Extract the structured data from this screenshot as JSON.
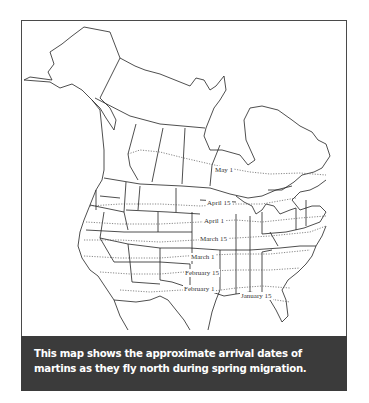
{
  "map": {
    "title": "Martin spring migration arrival dates",
    "region": "North America",
    "isolines": [
      {
        "label": "May 1",
        "x": 214,
        "y": 170
      },
      {
        "label": "April 15",
        "x": 206,
        "y": 200
      },
      {
        "label": "April 1",
        "x": 203,
        "y": 218
      },
      {
        "label": "March 15",
        "x": 199,
        "y": 235
      },
      {
        "label": "March 1",
        "x": 190,
        "y": 254
      },
      {
        "label": "February 15",
        "x": 184,
        "y": 270
      },
      {
        "label": "February 1",
        "x": 183,
        "y": 285
      },
      {
        "label": "January 15",
        "x": 240,
        "y": 292
      }
    ],
    "colors": {
      "outline": "#222222",
      "isoline": "#555555",
      "caption_bg": "#3b3b3b",
      "caption_text": "#ffffff"
    }
  },
  "caption": {
    "text": "This map shows the approximate arrival dates of martins as they fly north during spring migration."
  }
}
